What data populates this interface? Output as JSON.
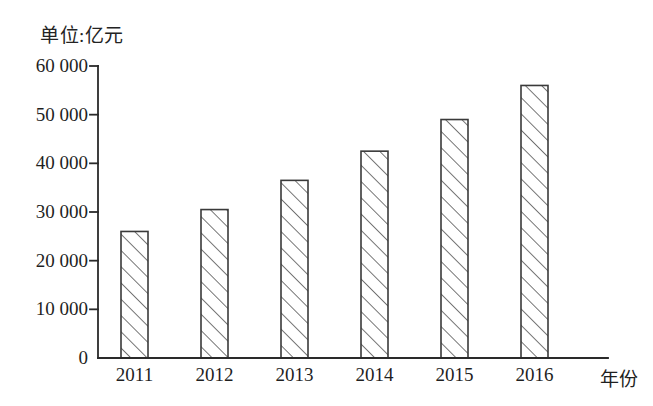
{
  "chart_data": {
    "type": "bar",
    "title": "单位:亿元",
    "xlabel": "年份",
    "ylabel": "",
    "categories": [
      "2011",
      "2012",
      "2013",
      "2014",
      "2015",
      "2016"
    ],
    "values": [
      26000,
      30500,
      36500,
      42500,
      49000,
      56000
    ],
    "ylim": [
      0,
      60000
    ],
    "ytick_values": [
      0,
      10000,
      20000,
      30000,
      40000,
      50000,
      60000
    ],
    "ytick_labels": [
      "0",
      "10 000",
      "20 000",
      "30 000",
      "40 000",
      "50 000",
      "60 000"
    ],
    "grid": false,
    "legend": null,
    "bar_fill": "hatch-diagonal-45",
    "colors": {
      "ink": "#1d1d1d",
      "axis": "#2a2a2a",
      "bar_edge": "#3a3a3a",
      "bar_hatch": "#4a4a4a",
      "background": "#ffffff"
    }
  },
  "axes": {
    "unit_caption": "单位:亿元",
    "x_axis_name": "年份"
  }
}
